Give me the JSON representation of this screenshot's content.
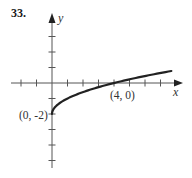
{
  "problem": {
    "number": "33."
  },
  "axes": {
    "x_label": "x",
    "y_label": "y"
  },
  "annotations": [
    {
      "text": "(0, -2)",
      "x": 0,
      "y": -2
    },
    {
      "text": "(4, 0)",
      "x": 4,
      "y": 0
    }
  ],
  "colors": {
    "curve": "#222222",
    "axis": "#555555",
    "text": "#333333"
  },
  "chart_data": {
    "type": "line",
    "title": "33.",
    "xlabel": "x",
    "ylabel": "y",
    "function": "y = sqrt(x) - 2",
    "xlim": [
      -2.6,
      8.3
    ],
    "ylim": [
      -5.5,
      4.4
    ],
    "x_ticks": [
      -2,
      -1,
      1,
      2,
      3,
      4,
      5,
      6,
      7
    ],
    "y_ticks": [
      -5,
      -4,
      -3,
      -2,
      -1,
      1,
      2,
      3
    ],
    "grid": false,
    "legend": null,
    "series": [
      {
        "name": "y = sqrt(x) - 2",
        "x": [
          0,
          0.05,
          0.25,
          0.5,
          1,
          1.5,
          2,
          3,
          4,
          5,
          6,
          7,
          7.7
        ],
        "y": [
          -2,
          -1.78,
          -1.5,
          -1.29,
          -1,
          -0.78,
          -0.59,
          -0.27,
          0,
          0.24,
          0.45,
          0.65,
          0.77
        ]
      }
    ],
    "labeled_points": [
      {
        "label": "(0, -2)",
        "x": 0,
        "y": -2
      },
      {
        "label": "(4, 0)",
        "x": 4,
        "y": 0
      }
    ]
  }
}
